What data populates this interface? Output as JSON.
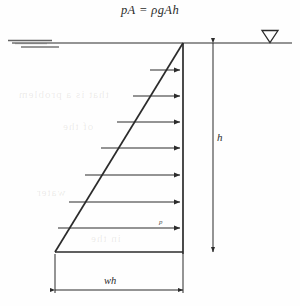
{
  "figure": {
    "equation": "pA = ρgAh",
    "type": "hydrostatic-pressure-distribution-diagram",
    "background_color": "#fefefe",
    "ink_color": "#2b2b2b"
  },
  "water_surface": {
    "label_symbol": "water-table-triangle",
    "line_y": 43,
    "line_x_start": 12,
    "line_x_end": 292,
    "hatch_marks": [
      {
        "x1": 8,
        "x2": 52,
        "y": 41
      },
      {
        "x1": 14,
        "x2": 46,
        "y": 44
      },
      {
        "x1": 20,
        "x2": 58,
        "y": 47
      }
    ],
    "triangle_marker_x": 270
  },
  "wall": {
    "x": 183,
    "top_y": 43,
    "bottom_y": 252
  },
  "pressure_triangle": {
    "apex_x": 183,
    "apex_y": 43,
    "base_left_x": 55,
    "base_y": 252,
    "description": "triangular pressure distribution increasing linearly with depth"
  },
  "pressure_arrows": [
    {
      "y": 70,
      "tail_x": 150
    },
    {
      "y": 96,
      "tail_x": 133
    },
    {
      "y": 122,
      "tail_x": 117
    },
    {
      "y": 148,
      "tail_x": 101
    },
    {
      "y": 175,
      "tail_x": 85
    },
    {
      "y": 202,
      "tail_x": 69
    },
    {
      "y": 228,
      "tail_x": 58
    },
    {
      "y": 251,
      "tail_x": 56
    }
  ],
  "pressure_label": {
    "text": "p",
    "x": 160,
    "y": 221
  },
  "depth_dimension": {
    "label": "h",
    "line_x": 213,
    "top_y": 43,
    "bottom_y": 252,
    "label_x": 217,
    "label_y": 137
  },
  "base_dimension": {
    "label": "wh",
    "line_y": 290,
    "left_x": 55,
    "right_x": 183,
    "label_x": 104,
    "label_y": 279
  },
  "bleed_through_text": [
    {
      "text": "that is a problem",
      "x": 18,
      "y": 88
    },
    {
      "text": "of the",
      "x": 62,
      "y": 120
    },
    {
      "text": "water",
      "x": 36,
      "y": 186
    },
    {
      "text": "in the",
      "x": 90,
      "y": 232
    }
  ]
}
